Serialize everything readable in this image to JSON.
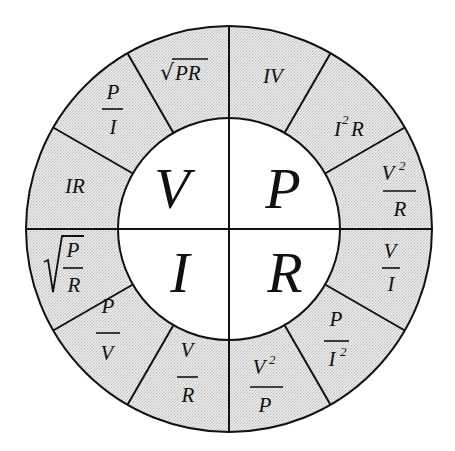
{
  "diagram": {
    "colors": {
      "ring_fill": "#e4e4e4",
      "inner_fill": "#ffffff",
      "stroke": "#111111",
      "background": "#ffffff"
    },
    "geometry": {
      "center_x": 229,
      "center_y": 229,
      "outer_radius": 203,
      "inner_radius": 111
    },
    "quadrants": [
      {
        "name": "voltage",
        "symbol": "V",
        "position": "top-left",
        "formulas": [
          {
            "display": "IR",
            "type": "product",
            "a": "IR"
          },
          {
            "display": "P/I",
            "type": "fraction",
            "num": "P",
            "den": "I"
          },
          {
            "display": "√PR",
            "type": "sqrt",
            "a": "PR"
          }
        ]
      },
      {
        "name": "power",
        "symbol": "P",
        "position": "top-right",
        "formulas": [
          {
            "display": "IV",
            "type": "product",
            "a": "IV"
          },
          {
            "display": "I²R",
            "type": "power-product",
            "base": "I",
            "exp": "2",
            "tail": "R"
          },
          {
            "display": "V²/R",
            "type": "fraction",
            "num": "V",
            "num_exp": "2",
            "den": "R"
          }
        ]
      },
      {
        "name": "resistance",
        "symbol": "R",
        "position": "bottom-right",
        "formulas": [
          {
            "display": "V/I",
            "type": "fraction",
            "num": "V",
            "den": "I"
          },
          {
            "display": "P/I²",
            "type": "fraction",
            "num": "P",
            "den": "I",
            "den_exp": "2"
          },
          {
            "display": "V²/P",
            "type": "fraction",
            "num": "V",
            "num_exp": "2",
            "den": "P"
          }
        ]
      },
      {
        "name": "current",
        "symbol": "I",
        "position": "bottom-left",
        "formulas": [
          {
            "display": "V/R",
            "type": "fraction",
            "num": "V",
            "den": "R"
          },
          {
            "display": "P/V",
            "type": "fraction",
            "num": "P",
            "den": "V"
          },
          {
            "display": "√(P/R)",
            "type": "sqrt-fraction",
            "num": "P",
            "den": "R"
          }
        ]
      }
    ],
    "centers": {
      "V": "V",
      "P": "P",
      "I": "I",
      "R": "R"
    },
    "segments": {
      "IR": "IR",
      "P_over_I_num": "P",
      "P_over_I_den": "I",
      "sqrtPR": "PR",
      "sqrt_sign": "√",
      "IV": "IV",
      "I2R_base": "I",
      "I2R_exp": "2",
      "I2R_tail": "R",
      "V2R_num": "V",
      "V2R_exp": "2",
      "V2R_den": "R",
      "V_over_I_num": "V",
      "V_over_I_den": "I",
      "P_over_I2_num": "P",
      "P_over_I2_den": "I",
      "P_over_I2_exp": "2",
      "V2P_num": "V",
      "V2P_exp": "2",
      "V2P_den": "P",
      "V_over_R_num": "V",
      "V_over_R_den": "R",
      "P_over_V_num": "P",
      "P_over_V_den": "V",
      "sqrtPR_frac_num": "P",
      "sqrtPR_frac_den": "R"
    }
  }
}
